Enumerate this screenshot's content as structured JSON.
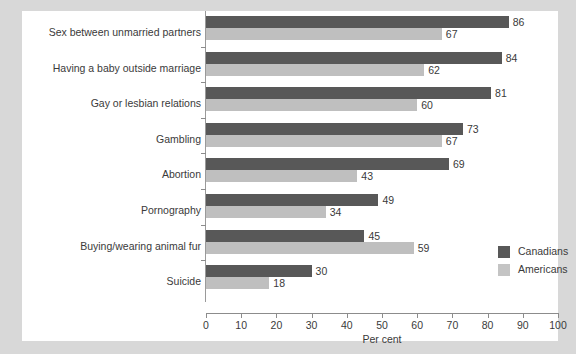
{
  "chart_data": {
    "type": "bar",
    "orientation": "horizontal",
    "title": "",
    "xlabel": "Per cent",
    "ylabel": "",
    "xlim": [
      0,
      100
    ],
    "xticks": [
      0,
      10,
      20,
      30,
      40,
      50,
      60,
      70,
      80,
      90,
      100
    ],
    "grid": false,
    "legend_position": "right",
    "categories": [
      "Sex between unmarried partners",
      "Having a baby outside marriage",
      "Gay or lesbian relations",
      "Gambling",
      "Abortion",
      "Pornography",
      "Buying/wearing animal fur",
      "Suicide"
    ],
    "series": [
      {
        "name": "Canadians",
        "color": "#585858",
        "values": [
          86,
          84,
          81,
          73,
          69,
          49,
          45,
          30
        ]
      },
      {
        "name": "Americans",
        "color": "#bfbfbf",
        "values": [
          67,
          62,
          60,
          67,
          43,
          34,
          59,
          18
        ]
      }
    ]
  },
  "legend": {
    "items": [
      {
        "label": "Canadians",
        "color": "#585858"
      },
      {
        "label": "Americans",
        "color": "#c4c4c4"
      }
    ]
  },
  "axis": {
    "x_title": "Per cent",
    "tick_labels": [
      "0",
      "10",
      "20",
      "30",
      "40",
      "50",
      "60",
      "70",
      "80",
      "90",
      "100"
    ]
  }
}
